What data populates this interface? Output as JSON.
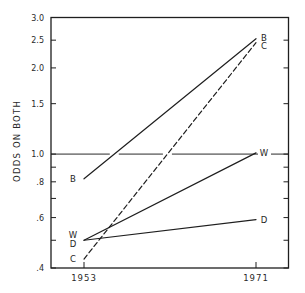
{
  "chart_data": {
    "type": "line",
    "title": "",
    "xlabel": "",
    "ylabel": "ODDS ON BOTH",
    "yscale": "log",
    "ylim": [
      0.4,
      3.0
    ],
    "x": [
      1953,
      1971
    ],
    "x_tick_labels": [
      "1953",
      "1971"
    ],
    "y_ticks": [
      0.4,
      0.6,
      0.8,
      1.0,
      1.5,
      2.0,
      2.5,
      3.0
    ],
    "y_tick_labels": [
      ".4",
      ".6",
      ".8",
      "1.0",
      "1.5",
      "2.0",
      "2.5",
      "3.0"
    ],
    "y_minor_ticks": [
      0.5,
      0.7,
      0.9
    ],
    "reference_line": {
      "y": 1.0
    },
    "grid": false,
    "legend": "none (series labeled at line ends)",
    "series": [
      {
        "name": "B",
        "values": [
          0.82,
          2.53
        ],
        "style": "solid"
      },
      {
        "name": "W",
        "values": [
          0.5,
          1.01
        ],
        "style": "solid"
      },
      {
        "name": "D",
        "values": [
          0.5,
          0.59
        ],
        "style": "solid"
      },
      {
        "name": "C",
        "values": [
          0.43,
          2.45
        ],
        "style": "dashed"
      }
    ]
  }
}
